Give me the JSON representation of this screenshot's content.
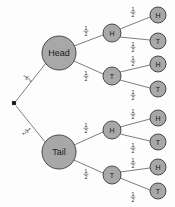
{
  "diagram": {
    "type": "probability-tree",
    "background_color": "#fdfdfd",
    "node_fill_color": "#a8a8a8",
    "node_stroke_color": "#3a3a3a",
    "edge_color": "#6f6f6f",
    "root": {
      "name": "root-node",
      "shape": "square",
      "x": 14,
      "y": 103,
      "size": 3.6
    },
    "levels": [
      {
        "level": 1,
        "radius": 17,
        "label_size": "big",
        "nodes": [
          {
            "id": "n-head",
            "label": "Head",
            "x": 59,
            "y": 53,
            "outcome": "H"
          },
          {
            "id": "n-tail",
            "label": "Tail",
            "x": 59,
            "y": 152,
            "outcome": "T"
          }
        ]
      },
      {
        "level": 2,
        "radius": 9,
        "label_size": "small",
        "nodes": [
          {
            "id": "n-hh",
            "label": "H",
            "x": 112,
            "y": 33,
            "outcome": "H"
          },
          {
            "id": "n-ht",
            "label": "T",
            "x": 112,
            "y": 76,
            "outcome": "T"
          },
          {
            "id": "n-th",
            "label": "H",
            "x": 112,
            "y": 130,
            "outcome": "H"
          },
          {
            "id": "n-tt",
            "label": "T",
            "x": 112,
            "y": 175,
            "outcome": "T"
          }
        ]
      },
      {
        "level": 3,
        "radius": 8,
        "label_size": "small",
        "nodes": [
          {
            "id": "n-hhh",
            "label": "H",
            "x": 158,
            "y": 15,
            "outcome": "H"
          },
          {
            "id": "n-hht",
            "label": "T",
            "x": 158,
            "y": 41,
            "outcome": "T"
          },
          {
            "id": "n-hth",
            "label": "H",
            "x": 158,
            "y": 64,
            "outcome": "H"
          },
          {
            "id": "n-htt",
            "label": "T",
            "x": 158,
            "y": 89,
            "outcome": "T"
          },
          {
            "id": "n-thh",
            "label": "H",
            "x": 158,
            "y": 118,
            "outcome": "H"
          },
          {
            "id": "n-tht",
            "label": "T",
            "x": 158,
            "y": 142,
            "outcome": "T"
          },
          {
            "id": "n-tth",
            "label": "H",
            "x": 158,
            "y": 167,
            "outcome": "H"
          },
          {
            "id": "n-ttt",
            "label": "T",
            "x": 158,
            "y": 191,
            "outcome": "T"
          }
        ]
      }
    ],
    "edges": [
      {
        "id": "e-root-head",
        "from": "root",
        "to": "n-head",
        "x1": 16,
        "y1": 101,
        "x2": 46,
        "y2": 63
      },
      {
        "id": "e-root-tail",
        "from": "root",
        "to": "n-tail",
        "x1": 16,
        "y1": 106,
        "x2": 46,
        "y2": 143
      },
      {
        "id": "e-head-hh",
        "from": "n-head",
        "to": "n-hh",
        "x1": 74,
        "y1": 46,
        "x2": 103,
        "y2": 35
      },
      {
        "id": "e-head-ht",
        "from": "n-head",
        "to": "n-ht",
        "x1": 74,
        "y1": 61,
        "x2": 103,
        "y2": 74
      },
      {
        "id": "e-tail-th",
        "from": "n-tail",
        "to": "n-th",
        "x1": 74,
        "y1": 145,
        "x2": 103,
        "y2": 132
      },
      {
        "id": "e-tail-tt",
        "from": "n-tail",
        "to": "n-tt",
        "x1": 74,
        "y1": 160,
        "x2": 103,
        "y2": 173
      },
      {
        "id": "e-hh-hhh",
        "from": "n-hh",
        "to": "n-hhh",
        "x1": 120,
        "y1": 29,
        "x2": 150,
        "y2": 17
      },
      {
        "id": "e-hh-hht",
        "from": "n-hh",
        "to": "n-hht",
        "x1": 120,
        "y1": 37,
        "x2": 150,
        "y2": 40
      },
      {
        "id": "e-ht-hth",
        "from": "n-ht",
        "to": "n-hth",
        "x1": 120,
        "y1": 72,
        "x2": 150,
        "y2": 65
      },
      {
        "id": "e-ht-htt",
        "from": "n-ht",
        "to": "n-htt",
        "x1": 120,
        "y1": 80,
        "x2": 150,
        "y2": 88
      },
      {
        "id": "e-th-thh",
        "from": "n-th",
        "to": "n-thh",
        "x1": 120,
        "y1": 127,
        "x2": 150,
        "y2": 119
      },
      {
        "id": "e-th-tht",
        "from": "n-th",
        "to": "n-tht",
        "x1": 120,
        "y1": 134,
        "x2": 150,
        "y2": 141
      },
      {
        "id": "e-tt-tth",
        "from": "n-tt",
        "to": "n-tth",
        "x1": 120,
        "y1": 172,
        "x2": 150,
        "y2": 168
      },
      {
        "id": "e-tt-ttt",
        "from": "n-tt",
        "to": "n-ttt",
        "x1": 120,
        "y1": 178,
        "x2": 150,
        "y2": 190
      }
    ],
    "probability_labels": [
      {
        "id": "p-root-head",
        "edge": "e-root-head",
        "numerator": "1",
        "denominator": "2",
        "x": 27,
        "y": 78,
        "rotate": -52
      },
      {
        "id": "p-root-tail",
        "edge": "e-root-tail",
        "numerator": "1",
        "denominator": "2",
        "x": 27,
        "y": 131,
        "rotate": 52
      },
      {
        "id": "p-head-hh",
        "edge": "e-head-hh",
        "numerator": "1",
        "denominator": "2",
        "x": 86,
        "y": 31,
        "rotate": 0
      },
      {
        "id": "p-head-ht",
        "edge": "e-head-ht",
        "numerator": "1",
        "denominator": "2",
        "x": 86,
        "y": 76,
        "rotate": 0
      },
      {
        "id": "p-tail-th",
        "edge": "e-tail-th",
        "numerator": "1",
        "denominator": "2",
        "x": 86,
        "y": 128,
        "rotate": 0
      },
      {
        "id": "p-tail-tt",
        "edge": "e-tail-tt",
        "numerator": "1",
        "denominator": "2",
        "x": 86,
        "y": 174,
        "rotate": 0
      },
      {
        "id": "p-hh-hhh",
        "edge": "e-hh-hhh",
        "numerator": "1",
        "denominator": "2",
        "x": 133,
        "y": 12,
        "rotate": 0
      },
      {
        "id": "p-hh-hht",
        "edge": "e-hh-hht",
        "numerator": "1",
        "denominator": "2",
        "x": 133,
        "y": 47,
        "rotate": 0
      },
      {
        "id": "p-ht-hth",
        "edge": "e-ht-hth",
        "numerator": "1",
        "denominator": "2",
        "x": 133,
        "y": 61,
        "rotate": 0
      },
      {
        "id": "p-ht-htt",
        "edge": "e-ht-htt",
        "numerator": "1",
        "denominator": "2",
        "x": 133,
        "y": 95,
        "rotate": 0
      },
      {
        "id": "p-th-thh",
        "edge": "e-th-thh",
        "numerator": "1",
        "denominator": "2",
        "x": 133,
        "y": 114,
        "rotate": 0
      },
      {
        "id": "p-th-tht",
        "edge": "e-th-tht",
        "numerator": "1",
        "denominator": "2",
        "x": 133,
        "y": 148,
        "rotate": 0
      },
      {
        "id": "p-tt-tth",
        "edge": "e-tt-tth",
        "numerator": "1",
        "denominator": "2",
        "x": 133,
        "y": 163,
        "rotate": 0
      },
      {
        "id": "p-tt-ttt",
        "edge": "e-tt-ttt",
        "numerator": "1",
        "denominator": "2",
        "x": 133,
        "y": 197,
        "rotate": 0
      }
    ]
  }
}
